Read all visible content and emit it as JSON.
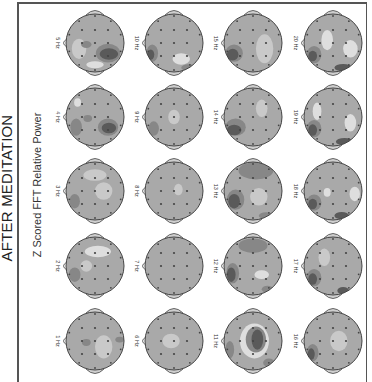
{
  "title": "AFTER MEDITATION",
  "subtitle": "Z Scored FFT Relative Power",
  "colors": {
    "base": "#a9a9a9",
    "light": "#c9c9c9",
    "lighter": "#dedede",
    "dark": "#878787",
    "darkest": "#5a5a5a",
    "outline": "#444444",
    "electrode": "#444444"
  },
  "layout": {
    "columns_x": [
      95,
      174,
      253,
      333
    ],
    "rows_y": [
      43,
      117,
      191,
      266,
      341
    ],
    "radius": 29
  },
  "maps": [
    {
      "label": "5 Hz",
      "col": 0,
      "row": 0
    },
    {
      "label": "10 Hz",
      "col": 1,
      "row": 0
    },
    {
      "label": "15 Hz",
      "col": 2,
      "row": 0
    },
    {
      "label": "20 Hz",
      "col": 3,
      "row": 0
    },
    {
      "label": "4 Hz",
      "col": 0,
      "row": 1
    },
    {
      "label": "9 Hz",
      "col": 1,
      "row": 1
    },
    {
      "label": "14 Hz",
      "col": 2,
      "row": 1
    },
    {
      "label": "19 Hz",
      "col": 3,
      "row": 1
    },
    {
      "label": "3 Hz",
      "col": 0,
      "row": 2
    },
    {
      "label": "8 Hz",
      "col": 1,
      "row": 2
    },
    {
      "label": "13 Hz",
      "col": 2,
      "row": 2
    },
    {
      "label": "18 Hz",
      "col": 3,
      "row": 2
    },
    {
      "label": "2 Hz",
      "col": 0,
      "row": 3
    },
    {
      "label": "7 Hz",
      "col": 1,
      "row": 3
    },
    {
      "label": "12 Hz",
      "col": 2,
      "row": 3
    },
    {
      "label": "17 Hz",
      "col": 3,
      "row": 3
    },
    {
      "label": "1 Hz",
      "col": 0,
      "row": 4
    },
    {
      "label": "6 Hz",
      "col": 1,
      "row": 4
    },
    {
      "label": "11 Hz",
      "col": 2,
      "row": 4
    },
    {
      "label": "16 Hz",
      "col": 3,
      "row": 4
    }
  ]
}
